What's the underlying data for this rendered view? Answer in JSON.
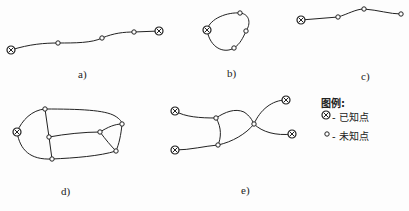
{
  "figures": [
    {
      "id": "a",
      "label": "a)"
    },
    {
      "id": "b",
      "label": "b)"
    },
    {
      "id": "c",
      "label": "c)"
    },
    {
      "id": "d",
      "label": "d)"
    },
    {
      "id": "e",
      "label": "e)"
    }
  ],
  "legend": {
    "title": "图例:",
    "items": [
      {
        "icon": "known-point-icon",
        "text": "- 已知点"
      },
      {
        "icon": "unknown-point-icon",
        "text": "- 未知点"
      }
    ]
  },
  "colors": {
    "stroke": "#222222",
    "background": "#fdfdfd"
  }
}
